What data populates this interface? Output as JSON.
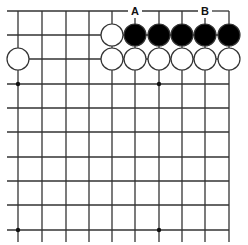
{
  "board": {
    "description": "Go board corner diagram (top edge, partial view)",
    "columns_x": [
      18,
      42,
      66,
      89,
      112,
      135,
      159,
      182,
      205,
      229
    ],
    "rows_y": [
      11,
      35,
      59,
      84,
      108,
      132,
      157,
      181,
      205,
      230
    ],
    "line_color": "#333333",
    "star_points": [
      {
        "col": 0,
        "row": 3
      },
      {
        "col": 6,
        "row": 3
      },
      {
        "col": 0,
        "row": 9
      },
      {
        "col": 6,
        "row": 9
      }
    ],
    "labels": [
      {
        "text": "A",
        "col": 5,
        "row": 0
      },
      {
        "text": "B",
        "col": 8,
        "row": 0
      }
    ],
    "stones": [
      {
        "color": "white",
        "col": 4,
        "row": 1
      },
      {
        "color": "black",
        "col": 5,
        "row": 1
      },
      {
        "color": "black",
        "col": 6,
        "row": 1
      },
      {
        "color": "black",
        "col": 7,
        "row": 1
      },
      {
        "color": "black",
        "col": 8,
        "row": 1
      },
      {
        "color": "black",
        "col": 9,
        "row": 1
      },
      {
        "color": "white",
        "col": 0,
        "row": 2
      },
      {
        "color": "white",
        "col": 4,
        "row": 2
      },
      {
        "color": "white",
        "col": 5,
        "row": 2
      },
      {
        "color": "white",
        "col": 6,
        "row": 2
      },
      {
        "color": "white",
        "col": 7,
        "row": 2
      },
      {
        "color": "white",
        "col": 8,
        "row": 2
      },
      {
        "color": "white",
        "col": 9,
        "row": 2
      }
    ],
    "colors": {
      "black_stone": "#000000",
      "white_stone": "#ffffff",
      "stone_outline": "#333333"
    }
  }
}
